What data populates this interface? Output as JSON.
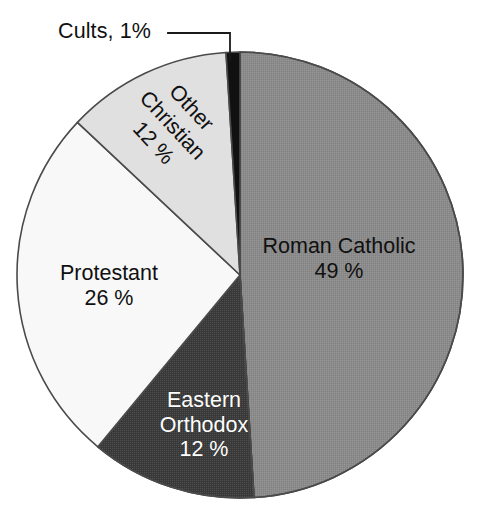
{
  "chart_data": {
    "type": "pie",
    "title": "",
    "subtitle": "",
    "xlabel": "",
    "ylabel": "",
    "grid": false,
    "legend_position": "none",
    "labels_inside": true,
    "start_angle_deg": 0,
    "direction": "clockwise",
    "categories": [
      "Roman Catholic",
      "Eastern Orthodox",
      "Protestant",
      "Other Christian",
      "Cults"
    ],
    "values": [
      49,
      12,
      26,
      12,
      1
    ],
    "value_suffix": "%",
    "colors": [
      "#8a8a8a",
      "#3a3a3a",
      "#f8f8f8",
      "#e0e0e0",
      "#111111"
    ],
    "slices": [
      {
        "name": "Roman Catholic",
        "value": 49,
        "label_name": "Roman Catholic",
        "label_value": "49 %",
        "color": "#8a8a8a",
        "text_color": "#101010",
        "start_deg": 0,
        "end_deg": 176.4
      },
      {
        "name": "Eastern Orthodox",
        "value": 12,
        "label_name_line1": "Eastern",
        "label_name_line2": "Orthodox",
        "label_value": "12 %",
        "color": "#3a3a3a",
        "text_color": "#ffffff",
        "start_deg": 176.4,
        "end_deg": 219.6
      },
      {
        "name": "Protestant",
        "value": 26,
        "label_name": "Protestant",
        "label_value": "26 %",
        "color": "#f8f8f8",
        "text_color": "#101010",
        "start_deg": 219.6,
        "end_deg": 313.2
      },
      {
        "name": "Other Christian",
        "value": 12,
        "label_name_line1": "Other",
        "label_name_line2": "Christian",
        "label_value": "12 %",
        "color": "#e0e0e0",
        "text_color": "#101010",
        "start_deg": 313.2,
        "end_deg": 356.4
      },
      {
        "name": "Cults",
        "value": 1,
        "label_name": "Cults, 1%",
        "label_value": "1%",
        "color": "#111111",
        "text_color": "#101010",
        "start_deg": 356.4,
        "end_deg": 360
      }
    ],
    "callout": {
      "text": "Cults, 1%",
      "points_to": "Cults"
    },
    "geometry": {
      "center_x": 240,
      "center_y": 275,
      "radius": 223
    }
  },
  "labels": {
    "cults": "Cults, 1%",
    "roman_catholic_name": "Roman Catholic",
    "roman_catholic_value": "49 %",
    "protestant_name": "Protestant",
    "protestant_value": "26 %",
    "eastern_orthodox_name_1": "Eastern",
    "eastern_orthodox_name_2": "Orthodox",
    "eastern_orthodox_value": "12 %",
    "other_christian_name_1": "Other",
    "other_christian_name_2": "Christian",
    "other_christian_value": "12 %"
  }
}
